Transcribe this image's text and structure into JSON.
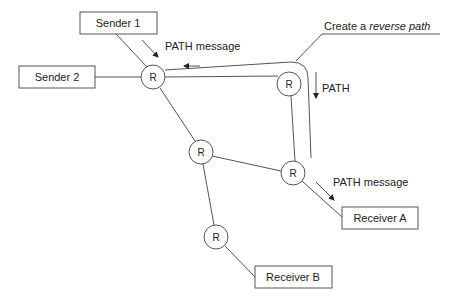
{
  "diagram": {
    "senders": [
      {
        "id": "sender1",
        "label": "Sender 1"
      },
      {
        "id": "sender2",
        "label": "Sender 2"
      }
    ],
    "receivers": [
      {
        "id": "receiverA",
        "label": "Receiver A"
      },
      {
        "id": "receiverB",
        "label": "Receiver B"
      }
    ],
    "routers": [
      {
        "id": "r1",
        "label": "R"
      },
      {
        "id": "r2",
        "label": "R"
      },
      {
        "id": "r3",
        "label": "R"
      },
      {
        "id": "r4",
        "label": "R"
      },
      {
        "id": "r5",
        "label": "R"
      }
    ],
    "edges": [
      [
        "sender1",
        "r1"
      ],
      [
        "sender2",
        "r1"
      ],
      [
        "r1",
        "r2"
      ],
      [
        "r1",
        "r3"
      ],
      [
        "r2",
        "r4"
      ],
      [
        "r3",
        "r4"
      ],
      [
        "r3",
        "r5"
      ],
      [
        "r4",
        "receiverA"
      ],
      [
        "r5",
        "receiverB"
      ]
    ],
    "annotations": {
      "path_message_top": "PATH message",
      "path_label": "PATH",
      "path_message_bottom": "PATH message",
      "reverse_path_prefix": "Create a ",
      "reverse_path_italic": "reverse path"
    }
  }
}
